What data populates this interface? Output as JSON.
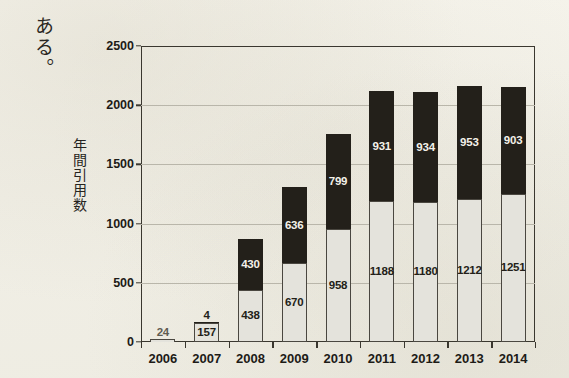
{
  "page": {
    "body_text": "ある。",
    "background_color": "#f4f2ea"
  },
  "chart_data": {
    "type": "bar",
    "subtype": "stacked-bar",
    "title": "",
    "xlabel": "",
    "ylabel": "年間引用数",
    "categories": [
      "2006",
      "2007",
      "2008",
      "2009",
      "2010",
      "2011",
      "2012",
      "2013",
      "2014"
    ],
    "series": [
      {
        "name": "lower-segment",
        "color": "#e4e3dc",
        "values": [
          24,
          157,
          438,
          670,
          958,
          1188,
          1180,
          1212,
          1251
        ]
      },
      {
        "name": "upper-segment",
        "color": "#23201a",
        "values": [
          0,
          4,
          430,
          636,
          799,
          931,
          934,
          953,
          903
        ]
      }
    ],
    "totals": [
      24,
      161,
      868,
      1306,
      1757,
      2119,
      2114,
      2165,
      2154
    ],
    "ylim": [
      0,
      2500
    ],
    "yticks": [
      0,
      500,
      1000,
      1500,
      2000,
      2500
    ],
    "ytick_labels": [
      "0",
      "500",
      "1000",
      "1500",
      "2000",
      "2500"
    ],
    "grid": true,
    "legend": null,
    "data_labels": {
      "lower": [
        "24",
        "157",
        "438",
        "670",
        "958",
        "1188",
        "1180",
        "1212",
        "1251"
      ],
      "upper": [
        "",
        "4",
        "430",
        "636",
        "799",
        "931",
        "934",
        "953",
        "903"
      ]
    }
  }
}
